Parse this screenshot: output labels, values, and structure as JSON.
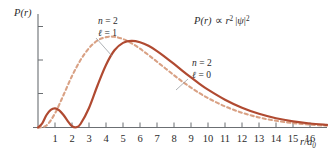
{
  "figure": {
    "background": "#ffffff",
    "y_axis_label": "P(r)",
    "x_axis_label_num": "r",
    "x_axis_label_den": "a",
    "x_axis_label_den_sub": "0",
    "formula": {
      "lhs": "P(r)",
      "prop": "∝",
      "r": "r",
      "r_exp": "2",
      "bar_open": "|",
      "psi": "ψ",
      "bar_close": "|",
      "psi_exp": "2"
    },
    "annotations": [
      {
        "id": "dashed-curve-label",
        "line1_var": "n",
        "line1_eq": "= 2",
        "line2_var": "ℓ",
        "line2_eq": "= 1",
        "x": 98,
        "y": 24
      },
      {
        "id": "solid-curve-label",
        "line1_var": "n",
        "line1_eq": "= 2",
        "line2_var": "ℓ",
        "line2_eq": "= 0",
        "x": 190,
        "y": 66
      }
    ]
  },
  "chart_data": {
    "type": "line",
    "title": "",
    "subtitle": "",
    "xlabel": "r/a0",
    "ylabel": "P(r)",
    "annotation_formula": "P(r) ∝ r^2 |ψ|^2",
    "grid": false,
    "legend_position": "inline-annotations",
    "xlim": [
      0,
      17
    ],
    "ylim": [
      0,
      1.1
    ],
    "x_ticks": [
      1,
      2,
      3,
      4,
      5,
      6,
      7,
      8,
      9,
      10,
      11,
      12,
      13,
      14,
      15,
      16
    ],
    "x_tick_labels": [
      "1",
      "2",
      "3",
      "4",
      "5",
      "6",
      "7",
      "8",
      "9",
      "10",
      "11",
      "12",
      "13",
      "14",
      "15",
      "16"
    ],
    "y_ticks": [
      0.33,
      0.66,
      1.0
    ],
    "y_tick_labels": [
      "",
      "",
      ""
    ],
    "series": [
      {
        "name": "n = 2, ℓ = 1",
        "style": "dashed",
        "color": "#d9a184",
        "x": [
          0.0,
          0.5,
          1.0,
          1.5,
          2.0,
          2.5,
          3.0,
          3.5,
          4.0,
          4.5,
          5.0,
          5.5,
          6.0,
          6.5,
          7.0,
          7.5,
          8.0,
          8.5,
          9.0,
          9.5,
          10.0,
          11.0,
          12.0,
          13.0,
          14.0,
          15.0,
          16.0,
          17.0
        ],
        "values": [
          0.0,
          0.021,
          0.145,
          0.332,
          0.527,
          0.69,
          0.812,
          0.89,
          0.925,
          0.928,
          0.905,
          0.862,
          0.806,
          0.742,
          0.673,
          0.604,
          0.535,
          0.469,
          0.408,
          0.352,
          0.301,
          0.216,
          0.151,
          0.103,
          0.069,
          0.045,
          0.029,
          0.018
        ]
      },
      {
        "name": "n = 2, ℓ = 0",
        "style": "solid",
        "color": "#b04a31",
        "x": [
          0.0,
          0.25,
          0.5,
          0.75,
          1.0,
          1.25,
          1.5,
          1.75,
          2.0,
          2.25,
          2.5,
          3.0,
          3.5,
          4.0,
          4.5,
          5.0,
          5.5,
          6.0,
          6.5,
          7.0,
          7.5,
          8.0,
          8.5,
          9.0,
          9.5,
          10.0,
          11.0,
          12.0,
          13.0,
          14.0,
          15.0,
          16.0,
          17.0
        ],
        "values": [
          0.0,
          0.042,
          0.128,
          0.18,
          0.196,
          0.176,
          0.128,
          0.066,
          0.014,
          0.002,
          0.036,
          0.2,
          0.43,
          0.64,
          0.79,
          0.866,
          0.886,
          0.872,
          0.836,
          0.782,
          0.718,
          0.65,
          0.58,
          0.512,
          0.447,
          0.387,
          0.284,
          0.202,
          0.14,
          0.095,
          0.063,
          0.041,
          0.026
        ]
      }
    ]
  }
}
